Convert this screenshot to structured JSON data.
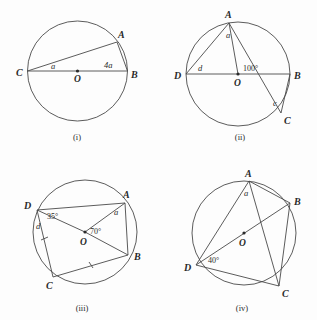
{
  "page": {
    "background_color": "#fdfdfd",
    "ink_color": "#4a4a4a",
    "text_color": "#2a2a2a"
  },
  "figures": [
    {
      "id": "i",
      "caption": "(i)",
      "center_label": "O",
      "vertices": [
        {
          "name": "A",
          "label": "A"
        },
        {
          "name": "B",
          "label": "B"
        },
        {
          "name": "C",
          "label": "C"
        }
      ],
      "angles": [
        {
          "name": "angle-at-c",
          "label": "a"
        },
        {
          "name": "angle-at-b",
          "label": "4a"
        }
      ]
    },
    {
      "id": "ii",
      "caption": "(ii)",
      "center_label": "O",
      "vertices": [
        {
          "name": "A",
          "label": "A"
        },
        {
          "name": "B",
          "label": "B"
        },
        {
          "name": "C",
          "label": "C"
        },
        {
          "name": "D",
          "label": "D"
        }
      ],
      "angles": [
        {
          "name": "angle-at-a",
          "label": "a"
        },
        {
          "name": "angle-at-d",
          "label": "d"
        },
        {
          "name": "angle-at-c",
          "label": "c"
        },
        {
          "name": "angle-at-o",
          "label": "100°"
        }
      ]
    },
    {
      "id": "iii",
      "caption": "(iii)",
      "center_label": "O",
      "vertices": [
        {
          "name": "A",
          "label": "A"
        },
        {
          "name": "B",
          "label": "B"
        },
        {
          "name": "C",
          "label": "C"
        },
        {
          "name": "D",
          "label": "D"
        }
      ],
      "angles": [
        {
          "name": "angle-at-d-upper",
          "label": "35°"
        },
        {
          "name": "angle-at-d-lower",
          "label": "d"
        },
        {
          "name": "angle-at-a",
          "label": "a"
        },
        {
          "name": "angle-at-o",
          "label": "70°"
        }
      ]
    },
    {
      "id": "iv",
      "caption": "(iv)",
      "center_label": "O",
      "vertices": [
        {
          "name": "A",
          "label": "A"
        },
        {
          "name": "B",
          "label": "B"
        },
        {
          "name": "C",
          "label": "C"
        },
        {
          "name": "D",
          "label": "D"
        }
      ],
      "angles": [
        {
          "name": "angle-at-a",
          "label": "a"
        },
        {
          "name": "angle-at-d",
          "label": "40°"
        }
      ]
    }
  ]
}
